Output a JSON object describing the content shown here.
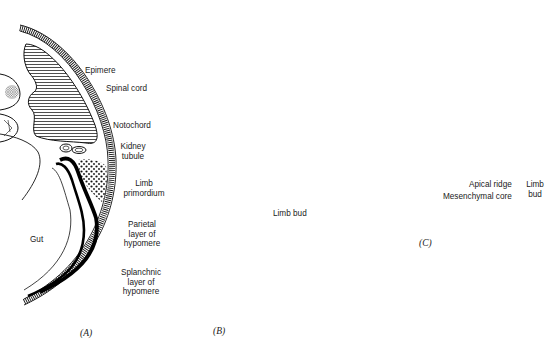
{
  "figure": {
    "type": "embryology-diagram",
    "panels": [
      {
        "id": "A",
        "label": "(A)",
        "annotations": [
          {
            "key": "epimere",
            "text": "Epimere"
          },
          {
            "key": "kidney_tubule",
            "lines": [
              "Kidney",
              "tubule"
            ]
          },
          {
            "key": "limb_primordium",
            "lines": [
              "Limb",
              "primordium"
            ]
          },
          {
            "key": "parietal",
            "lines": [
              "Parietal",
              "layer of",
              "hypomere"
            ]
          },
          {
            "key": "splanchnic",
            "lines": [
              "Splanchnic",
              "layer of",
              "hypomere"
            ]
          },
          {
            "key": "gut",
            "text": "Gut"
          }
        ]
      },
      {
        "id": "B",
        "label": "(B)",
        "annotations": [
          {
            "key": "spinal_cord",
            "text": "Spinal cord"
          },
          {
            "key": "notochord",
            "text": "Notochord"
          },
          {
            "key": "limb_bud",
            "text": "Limb bud"
          }
        ]
      },
      {
        "id": "C",
        "label": "(C)",
        "annotations": [
          {
            "key": "apical_ridge",
            "text": "Apical ridge"
          },
          {
            "key": "mesenchymal_core",
            "text": "Mesenchymal core"
          },
          {
            "key": "limb_bud_group",
            "lines": [
              "Limb",
              "bud"
            ]
          }
        ]
      }
    ]
  },
  "labels": {
    "A": {
      "epimere": "Epimere",
      "kidney_1": "Kidney",
      "kidney_2": "tubule",
      "limb_1": "Limb",
      "limb_2": "primordium",
      "parietal_1": "Parietal",
      "parietal_2": "layer of",
      "parietal_3": "hypomere",
      "splanchnic_1": "Splanchnic",
      "splanchnic_2": "layer of",
      "splanchnic_3": "hypomere",
      "gut": "Gut",
      "panel": "(A)"
    },
    "B": {
      "spinal_cord": "Spinal cord",
      "notochord": "Notochord",
      "limb_bud": "Limb bud",
      "panel": "(B)"
    },
    "C": {
      "apical_ridge": "Apical ridge",
      "mesenchymal_core": "Mesenchymal core",
      "limb_1": "Limb",
      "limb_2": "bud",
      "panel": "(C)"
    }
  },
  "colors": {
    "ink": "#1a1a1a",
    "background": "#ffffff"
  }
}
